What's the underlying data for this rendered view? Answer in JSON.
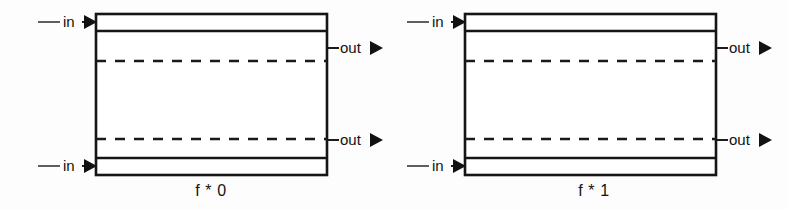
{
  "figure": {
    "background_color": "#fdfdfd",
    "stroke_color": "#151515",
    "diagrams": [
      {
        "id": "f-star-0",
        "caption": "f * 0",
        "ports": {
          "input_top": "in",
          "input_bottom": "in",
          "output_top": "out",
          "output_bottom": "out"
        },
        "icons": {
          "input_top_arrow": "arrow-right-icon",
          "input_bottom_arrow": "arrow-right-icon",
          "output_top_arrow": "arrow-right-icon",
          "output_bottom_arrow": "arrow-right-icon"
        }
      },
      {
        "id": "f-star-1",
        "caption": "f * 1",
        "ports": {
          "input_top": "in",
          "input_bottom": "in",
          "output_top": "out",
          "output_bottom": "out"
        },
        "icons": {
          "input_top_arrow": "arrow-right-icon",
          "input_bottom_arrow": "arrow-right-icon",
          "output_top_arrow": "arrow-right-icon",
          "output_bottom_arrow": "arrow-right-icon"
        }
      }
    ]
  }
}
